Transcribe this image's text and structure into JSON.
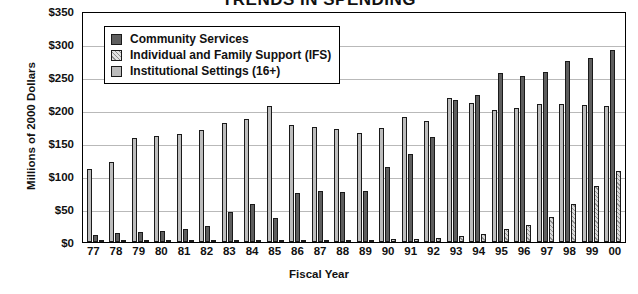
{
  "chart_data": {
    "type": "bar",
    "title": "TRENDS IN SPENDING",
    "xlabel": "Fiscal Year",
    "ylabel": "Millions of 2000 Dollars",
    "ylim": [
      0,
      350
    ],
    "ytick_values": [
      0,
      50,
      100,
      150,
      200,
      250,
      300,
      350
    ],
    "ytick_labels": [
      "$0",
      "$50",
      "$100",
      "$150",
      "$200",
      "$250",
      "$300",
      "$350"
    ],
    "grid": true,
    "legend_position": "upper-left-inside",
    "categories": [
      "77",
      "78",
      "79",
      "80",
      "81",
      "82",
      "83",
      "84",
      "85",
      "86",
      "87",
      "88",
      "89",
      "90",
      "91",
      "92",
      "93",
      "94",
      "95",
      "96",
      "97",
      "98",
      "99",
      "00"
    ],
    "series": [
      {
        "name": "Institutional Settings (16+)",
        "color": "#bcbcbc",
        "values": [
          110,
          121,
          157,
          160,
          163,
          170,
          181,
          186,
          206,
          177,
          175,
          171,
          165,
          172,
          189,
          183,
          218,
          210,
          200,
          203,
          209,
          209,
          208,
          206
        ]
      },
      {
        "name": "Community Services",
        "color": "#5e5e5e",
        "values": [
          11,
          13,
          15,
          17,
          20,
          24,
          46,
          58,
          36,
          74,
          78,
          76,
          77,
          113,
          134,
          159,
          215,
          222,
          256,
          251,
          258,
          275,
          279,
          291
        ]
      },
      {
        "name": "Individual and Family Support (IFS)",
        "color": "#d8d8d8",
        "values": [
          1,
          1,
          1,
          1,
          1,
          2,
          2,
          2,
          2,
          3,
          3,
          3,
          3,
          4,
          5,
          6,
          9,
          12,
          19,
          26,
          38,
          57,
          85,
          107
        ]
      }
    ],
    "series_draw_order_per_group": [
      "Institutional Settings (16+)",
      "Community Services",
      "Individual and Family Support (IFS)"
    ]
  },
  "legend": {
    "items": [
      {
        "label": "Community Services",
        "swatch": "cs"
      },
      {
        "label": "Individual and Family Support (IFS)",
        "swatch": "ifs"
      },
      {
        "label": "Institutional Settings (16+)",
        "swatch": "inst"
      }
    ]
  }
}
